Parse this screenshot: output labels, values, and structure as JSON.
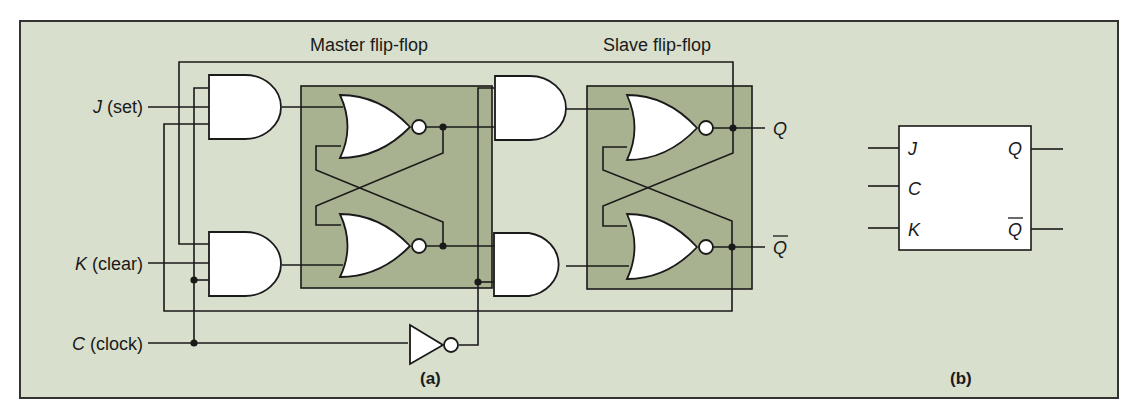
{
  "figure": {
    "colors": {
      "panel_bg": "#d9dfcd",
      "flipflop_box": "#a9b290",
      "gate_fill": "#ffffff",
      "wire": "#1a1a1a"
    },
    "panel_a": {
      "label": "(a)",
      "master_title": "Master flip-flop",
      "slave_title": "Slave flip-flop",
      "inputs": [
        {
          "letter": "J",
          "desc": " (set)"
        },
        {
          "letter": "K",
          "desc": " (clear)"
        },
        {
          "letter": "C",
          "desc": " (clock)"
        }
      ],
      "outputs": {
        "q": "Q",
        "q_bar": "Q"
      }
    },
    "panel_b": {
      "label": "(b)",
      "inputs": [
        "J",
        "C",
        "K"
      ],
      "outputs": [
        "Q",
        "Q"
      ]
    }
  }
}
